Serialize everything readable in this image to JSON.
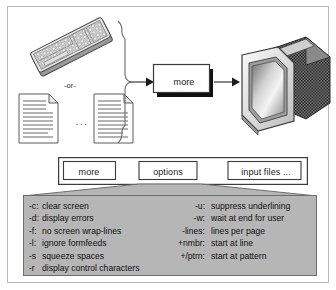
{
  "figure": {
    "background": "#ffffff",
    "border_color": "#b9b9b9",
    "panel_fill": "#b6b6b6",
    "panel_border": "#6e6e6e"
  },
  "flow": {
    "input_or_label": "-or-",
    "input_ellipsis": "...",
    "keyboard_icon": "keyboard-icon",
    "document_icon": "document-icon",
    "brace_icon": "input-brace",
    "arrow_icon": "arrow-right-icon",
    "process_label": "more",
    "output_icon": "crt-monitor-icon"
  },
  "signature": {
    "command": "more",
    "options": "options",
    "files": "input files ..."
  },
  "options_table": {
    "left": [
      {
        "flag": "-c:",
        "desc": "clear screen"
      },
      {
        "flag": "-d:",
        "desc": "display errors"
      },
      {
        "flag": "-f:",
        "desc": "no screen wrap-lines"
      },
      {
        "flag": "-l:",
        "desc": "ignore formfeeds"
      },
      {
        "flag": "-s",
        "desc": "squeeze spaces"
      },
      {
        "flag": "-r",
        "desc": "display control characters"
      }
    ],
    "right": [
      {
        "flag": "-u:",
        "desc": "suppress underlining"
      },
      {
        "flag": "-w:",
        "desc": "wait at end for user"
      },
      {
        "flag": "-lines:",
        "desc": "lines per page"
      },
      {
        "flag": "+nmbr:",
        "desc": "start at line"
      },
      {
        "flag": "+/ptrn:",
        "desc": "start at pattern"
      },
      {
        "flag": "",
        "desc": ""
      }
    ]
  }
}
